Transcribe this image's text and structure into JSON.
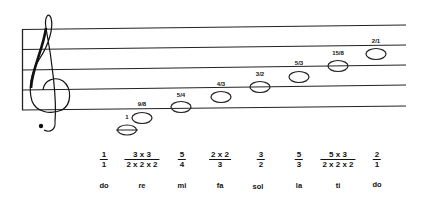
{
  "diagram": {
    "clef": "treble-clef",
    "staff_lines": 5,
    "notes": [
      {
        "syllable": "do",
        "ratio_label": "1",
        "numerator": "1",
        "denominator": "1"
      },
      {
        "syllable": "re",
        "ratio_label": "9/8",
        "numerator": "3 x 3",
        "denominator": "2 x 2 x 2"
      },
      {
        "syllable": "mi",
        "ratio_label": "5/4",
        "numerator": "5",
        "denominator": "4"
      },
      {
        "syllable": "fa",
        "ratio_label": "4/3",
        "numerator": "2 x 2",
        "denominator": "3"
      },
      {
        "syllable": "sol",
        "ratio_label": "3/2",
        "numerator": "3",
        "denominator": "2"
      },
      {
        "syllable": "la",
        "ratio_label": "5/3",
        "numerator": "5",
        "denominator": "3"
      },
      {
        "syllable": "ti",
        "ratio_label": "15/8",
        "numerator": "5 x 3",
        "denominator": "2 x 2 x 2"
      },
      {
        "syllable": "do",
        "ratio_label": "2/1",
        "numerator": "2",
        "denominator": "1"
      }
    ]
  }
}
